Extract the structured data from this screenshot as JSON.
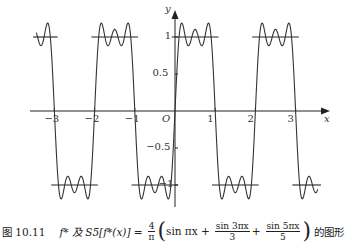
{
  "chart_data": {
    "type": "line",
    "xlabel": "x",
    "ylabel": "y",
    "origin_label": "O",
    "xlim": [
      -3.6,
      3.65
    ],
    "ylim": [
      -1.25,
      1.3
    ],
    "x_ticks": [
      -3,
      -2,
      -1,
      1,
      2,
      3
    ],
    "x_tick_labels": [
      "-3",
      "-2",
      "-1",
      "1",
      "2",
      "3"
    ],
    "y_ticks": [
      1,
      0.5,
      -0.5,
      -1
    ],
    "y_tick_labels": [
      "1",
      "0.5",
      "-0.5",
      "-1"
    ],
    "grid": false,
    "legend": "none",
    "series": [
      {
        "name": "f*(x)",
        "kind": "square-wave",
        "description": "odd square wave of period 2: +1 on (0,1), -1 on (-1,0); drawn as horizontal segments",
        "segments": [
          {
            "x": [
              -3.45,
              -3.0
            ],
            "y": 1
          },
          {
            "x": [
              -3.0,
              -2.0
            ],
            "y": -1
          },
          {
            "x": [
              -2.0,
              -1.0
            ],
            "y": 1
          },
          {
            "x": [
              -1.0,
              0.0
            ],
            "y": -1
          },
          {
            "x": [
              0.0,
              1.0
            ],
            "y": 1
          },
          {
            "x": [
              1.0,
              2.0
            ],
            "y": -1
          },
          {
            "x": [
              2.0,
              3.0
            ],
            "y": 1
          },
          {
            "x": [
              3.0,
              3.55
            ],
            "y": -1
          }
        ]
      },
      {
        "name": "S5[f*(x)]",
        "kind": "function",
        "formula": "(4/pi)*(sin(pi x) + sin(3 pi x)/3 + sin(5 pi x)/5)",
        "coefficients": [
          [
            1,
            1
          ],
          [
            3,
            0.3333333
          ],
          [
            5,
            0.2
          ]
        ],
        "scale": 1.2732395,
        "x_range": [
          -3.45,
          3.55
        ],
        "max": 1.18,
        "min": -1.18
      }
    ]
  },
  "axes": {
    "x_label": "x",
    "y_label": "y",
    "origin": "O"
  },
  "caption": {
    "figure_number": "图 10.11",
    "lhs": "f* 及 S5[f*(x)] =",
    "coef_num": "4",
    "coef_den": "π",
    "term1": "sin πx +",
    "term2_num": "sin 3πx",
    "term2_den": "3",
    "plus": "+",
    "term3_num": "sin 5πx",
    "term3_den": "5",
    "suffix": "的图形"
  }
}
